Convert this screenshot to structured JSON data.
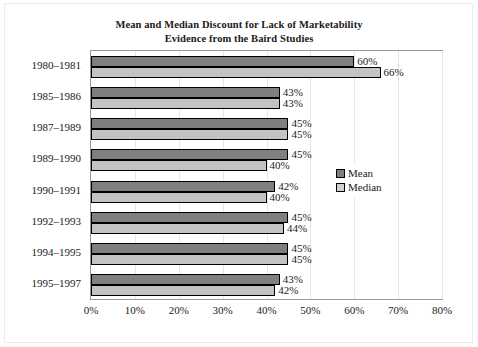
{
  "chart_data": {
    "type": "bar",
    "orientation": "horizontal",
    "title": "Mean and Median Discount for Lack of Marketability",
    "subtitle": "Evidence from the Baird Studies",
    "xlabel": "",
    "ylabel": "",
    "xlim": [
      0,
      80
    ],
    "grid": true,
    "legend_position": "center-right",
    "categories": [
      "1980–1981",
      "1985–1986",
      "1987–1989",
      "1989–1990",
      "1990–1991",
      "1992–1993",
      "1994–1995",
      "1995–1997"
    ],
    "series": [
      {
        "name": "Mean",
        "color": "#7f7f7f",
        "values": [
          60,
          43,
          45,
          45,
          42,
          45,
          45,
          43
        ],
        "labels": [
          "60%",
          "43%",
          "45%",
          "45%",
          "42%",
          "45%",
          "45%",
          "43%"
        ]
      },
      {
        "name": "Median",
        "color": "#c3c3c3",
        "values": [
          66,
          43,
          45,
          40,
          40,
          44,
          45,
          42
        ],
        "labels": [
          "66%",
          "43%",
          "45%",
          "40%",
          "40%",
          "44%",
          "45%",
          "42%"
        ]
      }
    ],
    "xticks": [
      0,
      10,
      20,
      30,
      40,
      50,
      60,
      70,
      80
    ],
    "xtick_labels": [
      "0%",
      "10%",
      "20%",
      "30%",
      "40%",
      "50%",
      "60%",
      "70%",
      "80%"
    ]
  },
  "legend": {
    "entries": [
      {
        "label": "Mean"
      },
      {
        "label": "Median"
      }
    ]
  }
}
